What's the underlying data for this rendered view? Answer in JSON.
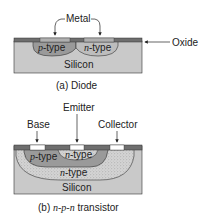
{
  "colors": {
    "silicon": "#c9c9c9",
    "oxide": "#6e6e6e",
    "metal_diode": "#a8a8a8",
    "p_type": "#9a9a9a",
    "n_type_diode": "#b9b9b9",
    "n_type_stipple": "#d2d2d2",
    "metal_contact": "#ffffff",
    "outline": "#333333"
  },
  "diode": {
    "metal_label": "Metal",
    "oxide_label": "Oxide",
    "p_label": "p-type",
    "p_label_italic": "p",
    "p_label_rest": "-type",
    "n_label_italic": "n",
    "n_label_rest": "-type",
    "silicon_label": "Silicon",
    "caption": "(a) Diode"
  },
  "transistor": {
    "base_label": "Base",
    "emitter_label": "Emitter",
    "collector_label": "Collector",
    "p_label_italic": "p",
    "p_label_rest": "-type",
    "n_emitter_italic": "n",
    "n_emitter_rest": "-type",
    "n_collector_italic": "n",
    "n_collector_rest": "-type",
    "silicon_label": "Silicon",
    "caption_prefix": "(b) ",
    "caption_italic": "n-p-n",
    "caption_suffix": " transistor"
  }
}
